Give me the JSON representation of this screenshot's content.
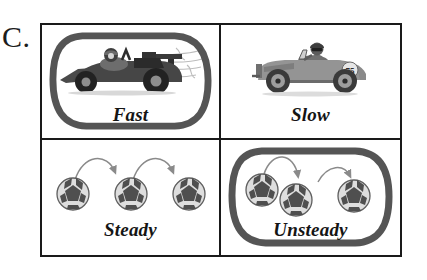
{
  "worksheet": {
    "question_label": "C.",
    "colors": {
      "frame": "#1a1a1a",
      "ink": "#151515",
      "selection_ring": "#555555",
      "ball_light": "#d9d9d9",
      "ball_dark": "#4a4a4a",
      "car_body": "#4d4d4d",
      "car_dark": "#262626",
      "arrow": "#7a7a7a",
      "speed_lines": "#b5b5b5"
    }
  },
  "panels": [
    {
      "id": "fast",
      "caption": "Fast",
      "artwork": "race-car-with-speed-lines",
      "selected": true,
      "position": "top-left"
    },
    {
      "id": "slow",
      "caption": "Slow",
      "artwork": "vintage-car",
      "car_number": "75",
      "selected": false,
      "position": "top-right"
    },
    {
      "id": "steady",
      "caption": "Steady",
      "artwork": "three-evenly-spaced-soccer-balls-with-arrows",
      "ball_count": 3,
      "selected": false,
      "position": "bottom-left"
    },
    {
      "id": "unsteady",
      "caption": "Unsteady",
      "artwork": "three-unevenly-spaced-soccer-balls-with-arrows",
      "ball_count": 3,
      "selected": true,
      "position": "bottom-right"
    }
  ]
}
